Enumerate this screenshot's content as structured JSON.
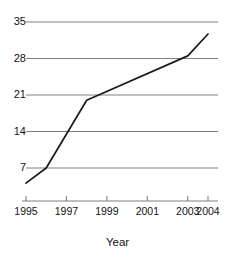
{
  "chart_data": {
    "type": "line",
    "title": "",
    "subtitle": "",
    "xlabel": "Year",
    "ylabel": "",
    "grid": true,
    "legend": false,
    "legend_position": "none",
    "xlim": [
      1995,
      2004
    ],
    "ylim": [
      0,
      35
    ],
    "yticks": [
      7,
      14,
      21,
      28,
      35
    ],
    "ytick_labels": [
      "7",
      "14",
      "21",
      "28",
      "35"
    ],
    "xticks": [
      1995,
      1997,
      1999,
      2001,
      2003,
      2004
    ],
    "xtick_labels": [
      "1995",
      "1997",
      "1999",
      "2001",
      "2003",
      "2004"
    ],
    "series": [
      {
        "name": "",
        "color": "#1a1a1a",
        "x": [
          1995,
          1996,
          1998,
          2003,
          2004
        ],
        "values": [
          4.1,
          7.0,
          20.0,
          28.5,
          32.7
        ]
      }
    ]
  },
  "style": {
    "line_color": "#1a1a1a",
    "grid_color": "#808080",
    "axis_color": "#808080",
    "text_color": "#111111",
    "background": "#ffffff"
  }
}
